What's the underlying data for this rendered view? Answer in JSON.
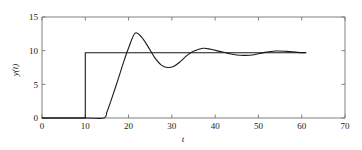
{
  "chart_data": {
    "type": "line",
    "title": "",
    "xlabel": "t",
    "ylabel": "y(t)",
    "xlim": [
      0,
      70
    ],
    "ylim": [
      0,
      15
    ],
    "xticks": [
      0,
      10,
      20,
      30,
      40,
      50,
      60,
      70
    ],
    "xticklabels": [
      "0",
      "10",
      "20",
      "30",
      "40",
      "50",
      "60",
      "70"
    ],
    "yticks": [
      0,
      5,
      10,
      15
    ],
    "yticklabels": [
      "0",
      "5",
      "10",
      "15"
    ],
    "grid": false,
    "legend": null,
    "line_color": "#1a1a1a",
    "axis_color": "#808080",
    "series": [
      {
        "name": "reference step",
        "x": [
          0,
          10,
          10,
          61
        ],
        "values": [
          0,
          0,
          9.7,
          9.7
        ]
      },
      {
        "name": "system response",
        "x": [
          0,
          10,
          14.3,
          15.0,
          16.0,
          17.0,
          18.0,
          19.0,
          20.0,
          21.5,
          23.0,
          24.5,
          26.0,
          27.5,
          29.0,
          30.5,
          32.0,
          33.5,
          35.0,
          37.2,
          39.0,
          41.0,
          43.0,
          45.0,
          47.0,
          49.0,
          51.5,
          54.0,
          56.5,
          59.0,
          61.0
        ],
        "values": [
          0,
          0,
          0,
          0.9,
          2.7,
          4.6,
          6.6,
          8.6,
          10.4,
          12.6,
          12.0,
          10.6,
          9.0,
          7.9,
          7.5,
          7.7,
          8.4,
          9.3,
          9.9,
          10.35,
          10.2,
          9.9,
          9.6,
          9.35,
          9.3,
          9.4,
          9.75,
          9.95,
          9.9,
          9.75,
          9.7
        ]
      }
    ]
  }
}
